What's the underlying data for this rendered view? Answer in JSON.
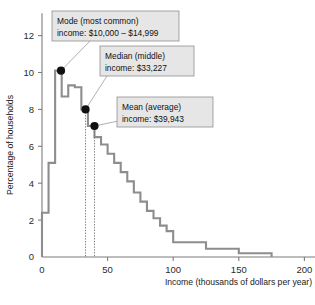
{
  "chart_data": {
    "type": "bar",
    "title": "",
    "subtitle": "",
    "xlabel": "Income (thousands of dollars per year)",
    "ylabel": "Percentage of households",
    "xlim": [
      0,
      215
    ],
    "ylim": [
      0,
      13
    ],
    "grid": false,
    "legend": "none",
    "x_ticks": [
      0,
      50,
      100,
      150,
      200
    ],
    "x_tick_labels": [
      "0",
      "50",
      "100",
      "150",
      "200"
    ],
    "y_ticks": [
      0,
      2,
      4,
      6,
      8,
      10,
      12
    ],
    "y_tick_labels": [
      "0",
      "2",
      "4",
      "6",
      "8",
      "10",
      "12"
    ],
    "bin_edges": [
      0,
      5,
      10,
      15,
      20,
      25,
      30,
      35,
      40,
      45,
      50,
      55,
      60,
      65,
      70,
      75,
      80,
      85,
      90,
      95,
      100,
      125,
      150,
      175
    ],
    "values": [
      2.4,
      5.1,
      10.1,
      8.7,
      9.3,
      9.2,
      8.0,
      7.1,
      6.5,
      6.1,
      5.6,
      5.1,
      4.6,
      4.1,
      3.5,
      3.0,
      2.5,
      2.1,
      1.7,
      1.4,
      0.8,
      0.45,
      0.2
    ],
    "categories": [
      "0-5",
      "5-10",
      "10-15",
      "15-20",
      "20-25",
      "25-30",
      "30-35",
      "35-40",
      "40-45",
      "45-50",
      "50-55",
      "55-60",
      "60-65",
      "65-70",
      "70-75",
      "75-80",
      "80-85",
      "85-90",
      "90-95",
      "95-100",
      "100-125",
      "125-150",
      "150-175"
    ],
    "annotations": [
      {
        "id": "mode",
        "line1": "Mode (most common)",
        "line2": "income: $10,000 – $14,999",
        "point_x": 14.5,
        "point_y": 10.1,
        "box_x": 52,
        "box_y": 11,
        "box_w": 127,
        "box_h": 30,
        "leader_from_x": 90,
        "leader_from_y": 41
      },
      {
        "id": "median",
        "line1": "Median (middle)",
        "line2": "income: $33,227",
        "point_x": 33.2,
        "point_y": 8.0,
        "box_x": 100,
        "box_y": 46,
        "box_w": 94,
        "box_h": 30,
        "leader_from_x": 107,
        "leader_from_y": 76
      },
      {
        "id": "mean",
        "line1": "Mean (average)",
        "line2": "income: $39,943",
        "point_x": 40.0,
        "point_y": 7.1,
        "box_x": 117,
        "box_y": 97,
        "box_w": 96,
        "box_h": 30,
        "leader_from_x": 123,
        "leader_from_y": 120
      }
    ],
    "stat_lines": [
      {
        "id": "median-line",
        "x": 33.2,
        "y_top": 8.0
      },
      {
        "id": "mean-line",
        "x": 40.0,
        "y_top": 7.1
      }
    ],
    "colors": {
      "histogram_stroke": "#8d8d8d",
      "axis": "#7d7d7d",
      "callout_fill": "#e6e6e6",
      "callout_border": "#8f8f8f",
      "dot": "#101010",
      "background": "#ffffff"
    }
  }
}
